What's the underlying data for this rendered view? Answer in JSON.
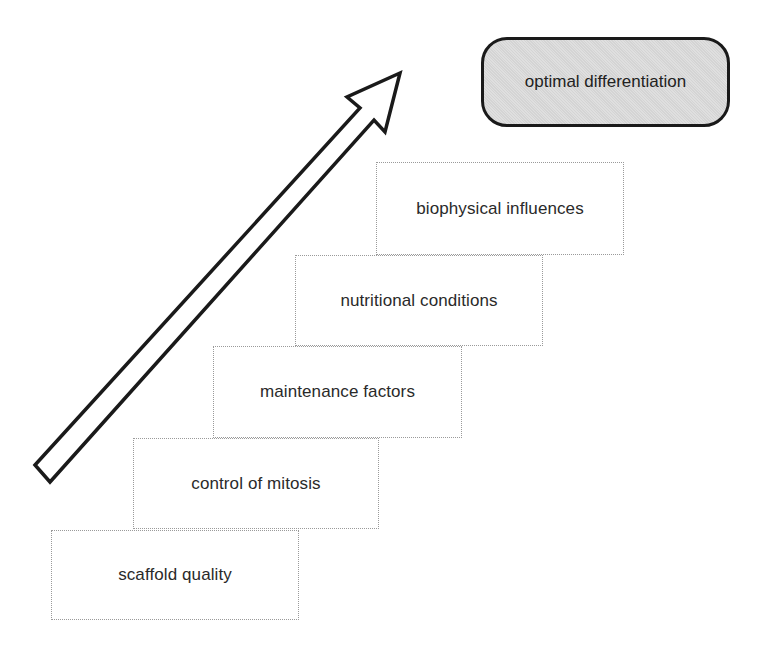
{
  "diagram": {
    "goal": {
      "label": "optimal differentiation"
    },
    "steps": [
      {
        "label": "scaffold quality"
      },
      {
        "label": "control of mitosis"
      },
      {
        "label": "maintenance factors"
      },
      {
        "label": "nutritional conditions"
      },
      {
        "label": "biophysical influences"
      }
    ],
    "arrow": {
      "direction": "up-right",
      "meaning": "progression toward goal"
    },
    "colors": {
      "goal_fill": "#d4d4d4",
      "goal_border": "#1a1a1a",
      "step_border": "#9a9a9a",
      "arrow_stroke": "#1a1a1a",
      "arrow_fill": "#ffffff"
    }
  }
}
